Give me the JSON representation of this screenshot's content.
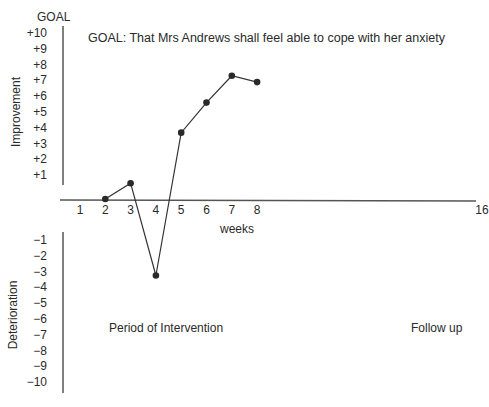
{
  "chart_data": {
    "type": "line",
    "title": "GOAL: That Mrs Andrews shall feel able to cope with her anxiety",
    "xlabel": "weeks",
    "ylabel_upper": "Improvement",
    "ylabel_lower": "Deterioration",
    "y_top_label": "GOAL",
    "x_ticks": [
      "1",
      "2",
      "3",
      "4",
      "5",
      "6",
      "7",
      "8",
      "16"
    ],
    "y_ticks_positive": [
      "+10",
      "+9",
      "+8",
      "+7",
      "+6",
      "+5",
      "+4",
      "+3",
      "+2",
      "+1"
    ],
    "y_ticks_negative": [
      "−1",
      "−2",
      "−3",
      "−4",
      "−5",
      "−6",
      "−7",
      "−8",
      "−9",
      "−10"
    ],
    "ylim": [
      -10,
      10
    ],
    "series": [
      {
        "name": "Mrs Andrews",
        "x": [
          2,
          3,
          4,
          5,
          6,
          7,
          8
        ],
        "values": [
          0,
          1,
          -3.8,
          4.2,
          6.1,
          7.8,
          7.4
        ]
      }
    ],
    "annotations": [
      "Period of Intervention",
      "Follow up"
    ],
    "grid": false,
    "legend": "none"
  }
}
